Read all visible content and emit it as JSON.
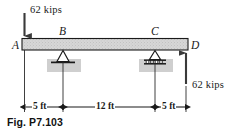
{
  "figure": {
    "caption": "Fig. P7.103",
    "beam": {
      "name": "horizontal-beam",
      "fill_color": "#d4d4d4",
      "outline_color": "#1a1a1a"
    },
    "points": [
      {
        "id": "A",
        "label": "A",
        "role": "left-end-load-point"
      },
      {
        "id": "B",
        "label": "B",
        "role": "pin-support"
      },
      {
        "id": "C",
        "label": "C",
        "role": "roller-support"
      },
      {
        "id": "D",
        "label": "D",
        "role": "right-end-reaction-point"
      }
    ],
    "loads": [
      {
        "id": "load-A",
        "label": "62 kips",
        "magnitude": 62,
        "unit": "kips",
        "direction": "down",
        "at": "A"
      },
      {
        "id": "load-D",
        "label": "62  kips",
        "magnitude": 62,
        "unit": "kips",
        "direction": "up",
        "at": "D"
      }
    ],
    "dimensions": [
      {
        "id": "dim-AB",
        "label": "5 ft",
        "value": 5,
        "unit": "ft",
        "from": "A",
        "to": "B"
      },
      {
        "id": "dim-BC",
        "label": "12 ft",
        "value": 12,
        "unit": "ft",
        "from": "B",
        "to": "C"
      },
      {
        "id": "dim-CD",
        "label": "5 ft",
        "value": 5,
        "unit": "ft",
        "from": "C",
        "to": "D"
      }
    ],
    "supports": [
      {
        "id": "support-B",
        "type": "pin",
        "at": "B"
      },
      {
        "id": "support-C",
        "type": "roller",
        "at": "C"
      }
    ]
  }
}
